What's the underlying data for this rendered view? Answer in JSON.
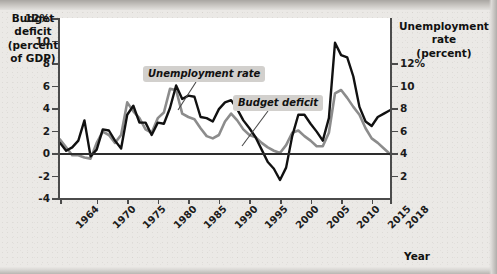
{
  "chart_data": {
    "type": "line",
    "title": "",
    "xlabel": "Year",
    "grid": false,
    "legend_position": "inline-annotations",
    "x_ticks": [
      "1964",
      "1970",
      "1975",
      "1980",
      "1985",
      "1990",
      "1995",
      "2000",
      "2005",
      "2010",
      "2015",
      "2018"
    ],
    "x_tick_values": [
      1964,
      1970,
      1975,
      1980,
      1985,
      1990,
      1995,
      2000,
      2005,
      2010,
      2015,
      2018
    ],
    "xlim": [
      1964,
      2018
    ],
    "left_axis": {
      "label_line1": "Budget",
      "label_line2": "deficit",
      "label_line3": "(percent",
      "label_line4": "of GDP)",
      "ticks": [
        "12%",
        "10",
        "8",
        "6",
        "4",
        "2",
        "0",
        "-2",
        "-4"
      ],
      "tick_values": [
        12,
        10,
        8,
        6,
        4,
        2,
        0,
        -2,
        -4
      ],
      "ylim": [
        -4,
        12
      ]
    },
    "right_axis": {
      "label_line1": "Unemployment",
      "label_line2": "rate",
      "label_line3": "(percent)",
      "ticks": [
        "12%",
        "10",
        "8",
        "6",
        "4",
        "2"
      ],
      "tick_values": [
        12,
        10,
        8,
        6,
        4,
        2
      ],
      "ylim": [
        0,
        16
      ]
    },
    "annotations": [
      {
        "name": "unemployment-rate-callout",
        "text": "Unemployment rate"
      },
      {
        "name": "budget-deficit-callout",
        "text": "Budget deficit"
      }
    ],
    "series": [
      {
        "name": "Unemployment rate",
        "color": "#8c8c8c",
        "axis": "right",
        "x": [
          1964,
          1965,
          1966,
          1967,
          1968,
          1969,
          1970,
          1971,
          1972,
          1973,
          1974,
          1975,
          1976,
          1977,
          1978,
          1979,
          1980,
          1981,
          1982,
          1983,
          1984,
          1985,
          1986,
          1987,
          1988,
          1989,
          1990,
          1991,
          1992,
          1993,
          1994,
          1995,
          1996,
          1997,
          1998,
          1999,
          2000,
          2001,
          2002,
          2003,
          2004,
          2005,
          2006,
          2007,
          2008,
          2009,
          2010,
          2011,
          2012,
          2013,
          2014,
          2015,
          2016,
          2017,
          2018
        ],
        "values": [
          5.2,
          4.5,
          3.8,
          3.8,
          3.6,
          3.5,
          4.9,
          5.9,
          5.6,
          4.9,
          5.6,
          8.5,
          7.7,
          7.1,
          6.1,
          5.8,
          7.1,
          7.6,
          9.7,
          9.6,
          7.5,
          7.2,
          7.0,
          6.2,
          5.5,
          5.3,
          5.6,
          6.8,
          7.5,
          6.9,
          6.1,
          5.6,
          5.4,
          4.9,
          4.5,
          4.2,
          4.0,
          4.7,
          5.8,
          6.0,
          5.5,
          5.1,
          4.6,
          4.6,
          5.8,
          9.3,
          9.6,
          8.9,
          8.1,
          7.4,
          6.2,
          5.3,
          4.9,
          4.4,
          3.9
        ]
      },
      {
        "name": "Budget deficit",
        "color": "#111111",
        "axis": "left",
        "x": [
          1964,
          1965,
          1966,
          1967,
          1968,
          1969,
          1970,
          1971,
          1972,
          1973,
          1974,
          1975,
          1976,
          1977,
          1978,
          1979,
          1980,
          1981,
          1982,
          1983,
          1984,
          1985,
          1986,
          1987,
          1988,
          1989,
          1990,
          1991,
          1992,
          1993,
          1994,
          1995,
          1996,
          1997,
          1998,
          1999,
          2000,
          2001,
          2002,
          2003,
          2004,
          2005,
          2006,
          2007,
          2008,
          2009,
          2010,
          2011,
          2012,
          2013,
          2014,
          2015,
          2016,
          2017,
          2018
        ],
        "values": [
          0.9,
          0.2,
          0.5,
          1.1,
          2.9,
          -0.3,
          0.3,
          2.1,
          2.0,
          1.1,
          0.4,
          3.4,
          4.2,
          2.7,
          2.7,
          1.6,
          2.7,
          2.6,
          4.0,
          6.0,
          4.8,
          5.1,
          5.0,
          3.2,
          3.1,
          2.8,
          3.9,
          4.5,
          4.7,
          3.9,
          2.9,
          2.2,
          1.4,
          0.3,
          -0.8,
          -1.4,
          -2.4,
          -1.3,
          1.5,
          3.4,
          3.4,
          2.6,
          1.9,
          1.1,
          3.1,
          9.8,
          8.7,
          8.5,
          6.8,
          4.1,
          2.8,
          2.4,
          3.2,
          3.5,
          3.8
        ]
      }
    ]
  }
}
